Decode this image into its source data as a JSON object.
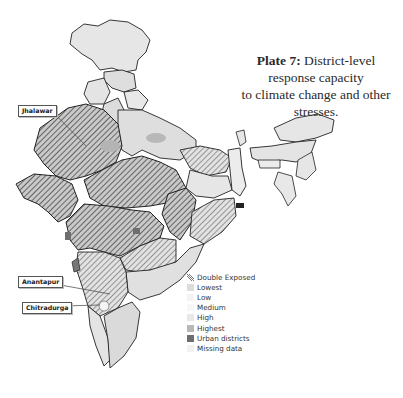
{
  "title": {
    "plate": "Plate 7:",
    "text_line1": " District-level response capacity",
    "text_line2": "to climate change and other stresses."
  },
  "callouts": [
    {
      "label": "Jhalawar"
    },
    {
      "label": "Anantapur"
    },
    {
      "label": "Chitradurga"
    }
  ],
  "legend": {
    "items": [
      {
        "label": "Double Exposed",
        "swatch": "hatch",
        "color": "#555555"
      },
      {
        "label": "Lowest",
        "swatch": "fill",
        "color": "#dcdcdc"
      },
      {
        "label": "Low",
        "swatch": "fill",
        "color": "#f4f4f4"
      },
      {
        "label": "Medium",
        "swatch": "fill",
        "color": "#f7f7f7"
      },
      {
        "label": "High",
        "swatch": "fill",
        "color": "#e8e8e8"
      },
      {
        "label": "Highest",
        "swatch": "fill",
        "color": "#b8b8b8"
      },
      {
        "label": "Urban districts",
        "swatch": "fill",
        "color": "#6e6e6e"
      },
      {
        "label": "Missing data",
        "swatch": "fill",
        "color": "#f2f2f2"
      }
    ]
  },
  "colors": {
    "border": "#222222",
    "hatch": "#3a3a3a",
    "highest": "#b4b4b4",
    "lowest": "#dedede",
    "urban": "#6e6e6e"
  }
}
